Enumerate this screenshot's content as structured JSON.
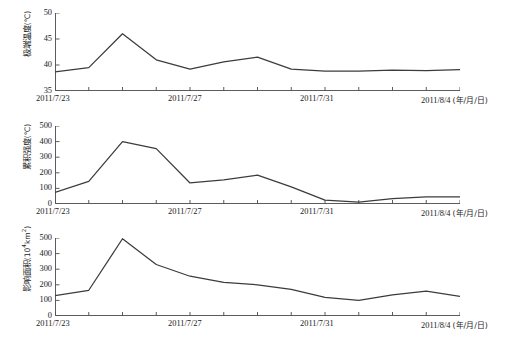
{
  "chart_data": [
    {
      "type": "line",
      "panel_index": 0,
      "title": "",
      "ylabel": "极端温度（℃）",
      "ylabel_text": "极端温度",
      "yunit": "(℃)",
      "xlabel": "",
      "ylim": [
        35,
        50
      ],
      "yticks": [
        35,
        40,
        45,
        50
      ],
      "ytick_labels": [
        "35",
        "40",
        "45",
        "50"
      ],
      "grid": false,
      "legend": "none",
      "x": [
        "2011/7/23",
        "2011/7/24",
        "2011/7/25",
        "2011/7/26",
        "2011/7/27",
        "2011/7/28",
        "2011/7/29",
        "2011/7/30",
        "2011/7/31",
        "2011/8/1",
        "2011/8/2",
        "2011/8/3",
        "2011/8/4"
      ],
      "categories": [
        "2011/7/23",
        "2011/7/24",
        "2011/7/25",
        "2011/7/26",
        "2011/7/27",
        "2011/7/28",
        "2011/7/29",
        "2011/7/30",
        "2011/7/31",
        "2011/8/1",
        "2011/8/2",
        "2011/8/3",
        "2011/8/4"
      ],
      "values": [
        38.7,
        39.5,
        46.0,
        41.0,
        39.2,
        40.6,
        41.5,
        39.2,
        38.8,
        38.8,
        39.0,
        38.9,
        39.1
      ],
      "xtick_labels": [
        "2011/7/23",
        "2011/7/27",
        "2011/7/31",
        "2011/8/4"
      ],
      "xtick_unit": "(年/月/日)"
    },
    {
      "type": "line",
      "panel_index": 1,
      "title": "",
      "ylabel": "累积强度（℃）",
      "ylabel_text": "累积强度",
      "yunit": "(℃)",
      "xlabel": "",
      "ylim": [
        0,
        500
      ],
      "yticks": [
        0,
        100,
        200,
        300,
        400,
        500
      ],
      "ytick_labels": [
        "0",
        "100",
        "200",
        "300",
        "400",
        "500"
      ],
      "grid": false,
      "legend": "none",
      "x": [
        "2011/7/23",
        "2011/7/24",
        "2011/7/25",
        "2011/7/26",
        "2011/7/27",
        "2011/7/28",
        "2011/7/29",
        "2011/7/30",
        "2011/7/31",
        "2011/8/1",
        "2011/8/2",
        "2011/8/3",
        "2011/8/4"
      ],
      "categories": [
        "2011/7/23",
        "2011/7/24",
        "2011/7/25",
        "2011/7/26",
        "2011/7/27",
        "2011/7/28",
        "2011/7/29",
        "2011/7/30",
        "2011/7/31",
        "2011/8/1",
        "2011/8/2",
        "2011/8/3",
        "2011/8/4"
      ],
      "values": [
        75,
        145,
        400,
        355,
        135,
        155,
        185,
        110,
        25,
        12,
        35,
        45,
        45
      ],
      "xtick_labels": [
        "2011/7/23",
        "2011/7/27",
        "2011/7/31",
        "2011/8/4"
      ],
      "xtick_unit": "(年/月/日)"
    },
    {
      "type": "line",
      "panel_index": 2,
      "title": "",
      "ylabel": "影响面积（10⁴km²）",
      "ylabel_text": "影响面积",
      "yunit": "(10",
      "yunit_sup": "4",
      "yunit_tail": "km",
      "yunit_sup2": "2",
      "yunit_close": ")",
      "xlabel": "",
      "ylim": [
        0,
        500
      ],
      "yticks": [
        0,
        100,
        200,
        300,
        400,
        500
      ],
      "ytick_labels": [
        "0",
        "100",
        "200",
        "300",
        "400",
        "500"
      ],
      "grid": false,
      "legend": "none",
      "x": [
        "2011/7/23",
        "2011/7/24",
        "2011/7/25",
        "2011/7/26",
        "2011/7/27",
        "2011/7/28",
        "2011/7/29",
        "2011/7/30",
        "2011/7/31",
        "2011/8/1",
        "2011/8/2",
        "2011/8/3",
        "2011/8/4"
      ],
      "categories": [
        "2011/7/23",
        "2011/7/24",
        "2011/7/25",
        "2011/7/26",
        "2011/7/27",
        "2011/7/28",
        "2011/7/29",
        "2011/7/30",
        "2011/7/31",
        "2011/8/1",
        "2011/8/2",
        "2011/8/3",
        "2011/8/4"
      ],
      "values": [
        130,
        165,
        495,
        330,
        255,
        215,
        200,
        170,
        120,
        100,
        135,
        160,
        125
      ],
      "xtick_labels": [
        "2011/7/23",
        "2011/7/27",
        "2011/7/31",
        "2011/8/4"
      ],
      "xtick_unit": "(年/月/日)"
    }
  ],
  "style": {
    "line_color": "#3c3c3c",
    "axis_color": "#4a4a4a",
    "background": "#ffffff"
  },
  "caption": ""
}
